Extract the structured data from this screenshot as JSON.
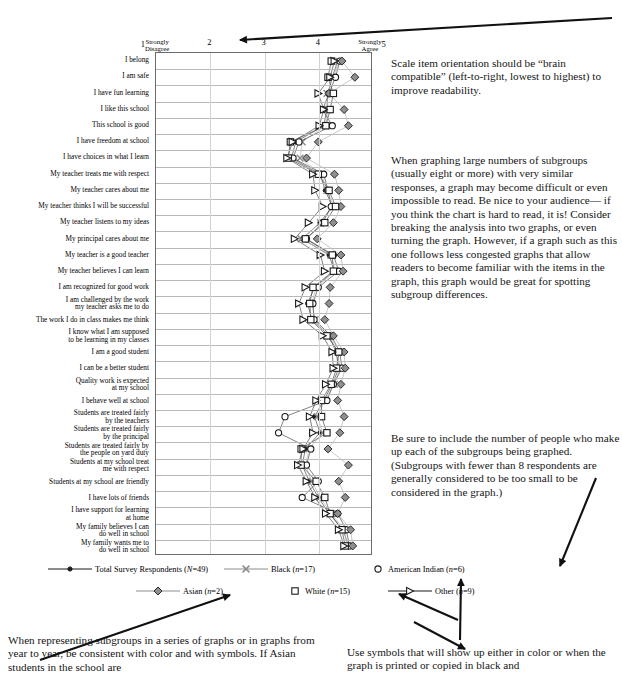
{
  "chart_data": {
    "type": "line",
    "orientation": "horizontal",
    "title": "",
    "xlabel": "",
    "ylabel": "",
    "xlim": [
      1,
      5
    ],
    "grid": true,
    "legend_position": "bottom",
    "axis_ticks": [
      {
        "value": 1,
        "num": "1",
        "anchor": "Strongly\nDisagree",
        "anchor_side": "right"
      },
      {
        "value": 2,
        "num": "2",
        "anchor": "",
        "anchor_side": ""
      },
      {
        "value": 3,
        "num": "3",
        "anchor": "",
        "anchor_side": ""
      },
      {
        "value": 4,
        "num": "4",
        "anchor": "",
        "anchor_side": ""
      },
      {
        "value": 5,
        "num": "5",
        "anchor": "Strongly\nAgree",
        "anchor_side": "left"
      }
    ],
    "categories": [
      "I belong",
      "I am safe",
      "I have fun learning",
      "I like this school",
      "This school is good",
      "I have freedom at school",
      "I have choices in what I learn",
      "My teacher treats me with respect",
      "My teacher cares about me",
      "My teacher thinks I will be successful",
      "My teacher listens to my ideas",
      "My principal cares about me",
      "My teacher is a good teacher",
      "My teacher believes I can learn",
      "I am recognized for good work",
      "I am challenged by the work\nmy teacher asks me to do",
      "The work I do in class makes me think",
      "I know what I am supposed\nto be learning in my classes",
      "I am a good student",
      "I can be a better student",
      "Quality work is expected\nat my school",
      "I behave well at school",
      "Students are treated fairly\nby the teachers",
      "Students are treated fairly\nby the principal",
      "Students are treated fairly by\nthe people on yard duty",
      "Students at my school treat\nme with respect",
      "Students at my school are friendly",
      "I have lots of friends",
      "I have support for learning\nat home",
      "My family believes I can\ndo well in school",
      "My family wants me to\ndo well in school"
    ],
    "series": [
      {
        "name": "Total Survey Respondents",
        "n_label": "N=49",
        "marker": "circle-filled",
        "color": "#1a1a1a",
        "values": [
          4.38,
          4.28,
          4.2,
          4.18,
          4.12,
          3.6,
          3.52,
          4.05,
          4.15,
          4.28,
          4.05,
          3.72,
          4.22,
          4.32,
          3.95,
          3.82,
          3.9,
          4.22,
          4.35,
          4.4,
          4.28,
          4.12,
          3.95,
          4.05,
          3.78,
          3.72,
          3.85,
          4.02,
          4.22,
          4.48,
          4.58
        ]
      },
      {
        "name": "Black",
        "n_label": "n=17",
        "marker": "x-cross",
        "color": "#8c8c8c",
        "values": [
          4.4,
          4.3,
          4.18,
          4.2,
          4.15,
          3.72,
          3.68,
          4.08,
          4.18,
          4.3,
          4.06,
          3.7,
          4.25,
          4.34,
          3.98,
          3.9,
          3.96,
          4.24,
          4.38,
          4.42,
          4.32,
          4.14,
          4.0,
          4.1,
          3.85,
          3.78,
          3.9,
          4.05,
          4.26,
          4.5,
          4.56
        ]
      },
      {
        "name": "American Indian",
        "n_label": "n=6",
        "marker": "circle-open",
        "color": "#1a1a1a",
        "values": [
          4.42,
          4.34,
          4.22,
          4.1,
          4.28,
          3.66,
          3.55,
          4.12,
          4.2,
          4.26,
          4.1,
          3.8,
          4.3,
          4.4,
          4.02,
          3.92,
          3.94,
          4.26,
          4.42,
          4.46,
          4.3,
          4.18,
          3.4,
          3.28,
          3.88,
          3.8,
          4.02,
          3.72,
          4.38,
          4.54,
          4.6
        ]
      },
      {
        "name": "Asian",
        "n_label": "n=2",
        "marker": "diamond-grey",
        "color": "#6f6f6f",
        "values": [
          4.46,
          4.7,
          4.22,
          4.5,
          4.58,
          4.02,
          3.8,
          4.32,
          4.4,
          4.44,
          4.3,
          4.0,
          4.44,
          4.48,
          4.24,
          4.22,
          4.14,
          4.3,
          4.5,
          4.52,
          4.44,
          4.38,
          4.5,
          4.42,
          4.2,
          4.58,
          4.4,
          4.52,
          4.38,
          4.62,
          4.66
        ]
      },
      {
        "name": "White",
        "n_label": "n=15",
        "marker": "square-open",
        "color": "#1a1a1a",
        "values": [
          4.26,
          4.2,
          4.3,
          4.24,
          4.16,
          3.5,
          3.46,
          4.02,
          4.22,
          4.34,
          4.14,
          3.78,
          4.28,
          4.3,
          3.92,
          3.86,
          3.88,
          4.18,
          4.4,
          4.36,
          4.26,
          4.08,
          4.08,
          4.18,
          3.7,
          3.7,
          3.98,
          4.14,
          4.24,
          4.46,
          4.52
        ]
      },
      {
        "name": "Other",
        "n_label": "n=9",
        "marker": "triangle-open",
        "color": "#1a1a1a",
        "values": [
          4.32,
          4.24,
          4.02,
          4.12,
          4.04,
          3.54,
          3.44,
          3.92,
          3.96,
          4.1,
          3.84,
          3.58,
          4.06,
          4.14,
          3.78,
          3.66,
          3.74,
          4.1,
          4.28,
          4.3,
          4.16,
          3.98,
          3.86,
          3.92,
          3.74,
          3.64,
          3.8,
          3.96,
          4.16,
          4.4,
          4.5
        ]
      }
    ]
  },
  "legend": {
    "rows": [
      [
        {
          "name": "Total Survey Respondents",
          "n_label": "(N=49)",
          "marker": "circle-filled",
          "line": "dark",
          "x": 0
        },
        {
          "name": "Black",
          "n_label": "(n=17)",
          "marker": "x-cross",
          "line": "grey",
          "x": 176
        },
        {
          "name": "American Indian",
          "n_label": "(n=6)",
          "marker": "circle-open",
          "line": "none",
          "x": 323
        }
      ],
      [
        {
          "name": "Asian",
          "n_label": "(n=2)",
          "marker": "diamond-grey",
          "line": "grey",
          "x": 88
        },
        {
          "name": "White",
          "n_label": "(n=15)",
          "marker": "square-open",
          "line": "none",
          "x": 240
        },
        {
          "name": "Other",
          "n_label": "(n=9)",
          "marker": "triangle-open",
          "line": "dark",
          "x": 340
        }
      ]
    ]
  },
  "notes": {
    "orientation": "Scale item orientation should be “brain compatible” (left-to-right, lowest to highest) to improve readability.",
    "subgroups": "When graphing large numbers of subgroups (usually eight or more) with very similar responses, a graph may become difficult or even impossible to read. Be nice to your audience— if you think the chart is hard to read, it is! Consider breaking the analysis into two graphs, or even turning the graph. However, if a graph such as this one follows less congested graphs that allow readers to become familiar with the items in the graph, this graph would be great for spotting subgroup differences.",
    "numbers": "Be sure to include the number of people who make up each of the subgroups being graphed. (Subgroups with fewer than 8 respondents are generally considered to be too small to be considered in the graph.)",
    "consistent": "When representing subgroups in a series of graphs or in graphs from year to year, be consistent with color and with symbols. If Asian students in the school are",
    "symbols": "Use symbols that will show up either in color or when the graph is printed or copied in black and"
  }
}
